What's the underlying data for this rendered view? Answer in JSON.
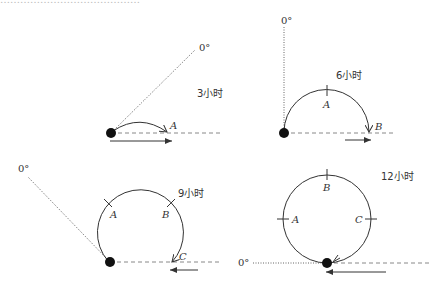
{
  "header": {
    "partial_text": "………………………………………"
  },
  "colors": {
    "stroke": "#333333",
    "dot": "#111111",
    "dotted": "#666666",
    "dashed": "#888888"
  },
  "panels": [
    {
      "id": "3h",
      "time_label": "3小时",
      "zero_label": "0°",
      "points": [
        "A"
      ]
    },
    {
      "id": "6h",
      "time_label": "6小时",
      "zero_label": "0°",
      "points": [
        "A",
        "B"
      ]
    },
    {
      "id": "9h",
      "time_label": "9小时",
      "zero_label": "0°",
      "points": [
        "A",
        "B",
        "C"
      ]
    },
    {
      "id": "12h",
      "time_label": "12小时",
      "zero_label": "0°",
      "points": [
        "A",
        "B",
        "C"
      ]
    }
  ]
}
